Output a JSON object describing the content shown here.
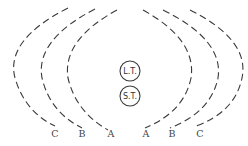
{
  "diagram": {
    "stroke_color": "#3a3a3a",
    "nodes": [
      {
        "id": "lt",
        "label": "L.T.",
        "cx": 130,
        "cy": 71,
        "r": 10
      },
      {
        "id": "st",
        "label": "S.T.",
        "cx": 130,
        "cy": 96,
        "r": 10
      }
    ],
    "arcs": [
      {
        "side": "left",
        "label": "C",
        "path": "M 68 8 Q 5 40 15 78 Q 25 112 55 126",
        "label_x": 55,
        "label_y": 137
      },
      {
        "side": "left",
        "label": "B",
        "path": "M 95 9 Q 35 40 42 78 Q 50 112 82 128",
        "label_x": 82,
        "label_y": 137
      },
      {
        "side": "left",
        "label": "A",
        "path": "M 117 10 Q 62 40 68 78 Q 76 112 108 130",
        "label_x": 111,
        "label_y": 137
      },
      {
        "side": "right",
        "label": "A",
        "path": "M 143 10 Q 197 40 191 78 Q 184 112 145 128",
        "label_x": 146,
        "label_y": 137
      },
      {
        "side": "right",
        "label": "B",
        "path": "M 163 10 Q 224 40 218 78 Q 211 112 170 128",
        "label_x": 172,
        "label_y": 137
      },
      {
        "side": "right",
        "label": "C",
        "path": "M 190 10 Q 250 40 242 78 Q 235 112 196 126",
        "label_x": 200,
        "label_y": 137
      }
    ]
  }
}
